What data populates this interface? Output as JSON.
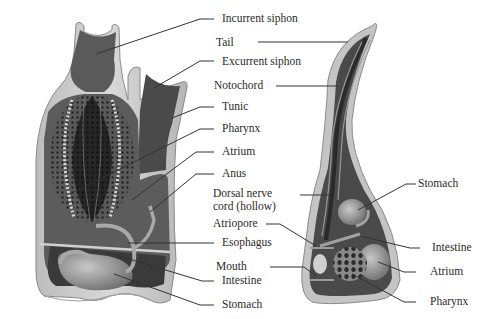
{
  "diagram": {
    "left_figure": "adult-tunicate",
    "right_figure": "tunicate-larva"
  },
  "labels": {
    "incurrent_siphon": "Incurrent siphon",
    "tail": "Tail",
    "excurrent_siphon": "Excurrent siphon",
    "notochord": "Notochord",
    "tunic": "Tunic",
    "pharynx_left": "Pharynx",
    "atrium_left": "Atrium",
    "anus": "Anus",
    "dorsal_nerve_1": "Dorsal nerve",
    "dorsal_nerve_2": "cord (hollow)",
    "atriopore": "Atriopore",
    "esophagus": "Esophagus",
    "mouth": "Mouth",
    "intestine_left": "Intestine",
    "stomach_left": "Stomach",
    "stomach_right": "Stomach",
    "intestine_right": "Intestine",
    "atrium_right": "Atrium",
    "pharynx_right": "Pharynx"
  },
  "colors": {
    "tunic": "#c9c9c9",
    "tunic_edge": "#8a8a8a",
    "body_dark": "#3c3c3c",
    "body_mid": "#6b6b6b",
    "organ_light": "#a8a8a8",
    "leader_line": "#333333",
    "text": "#2a2a2a"
  }
}
